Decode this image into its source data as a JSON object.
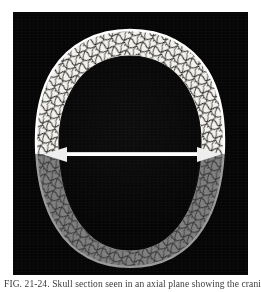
{
  "figure": {
    "kind": "medical-cross-section-illustration",
    "modality_label": "CT",
    "view": "axial skull cross-section",
    "panel": {
      "x": 13,
      "y": 12,
      "width": 235,
      "height": 263,
      "background_color": "#050505"
    },
    "colors": {
      "background": "#050505",
      "page": "#ffffff",
      "bone_bright": "#f4f2ee",
      "bone_bright_shadow": "#cfcbc4",
      "bone_dim": "#7e7e7e",
      "bone_dim_shadow": "#5a5a5a",
      "trabecular_line": "#1a1a1a",
      "cavity": "#050505",
      "marker_line": "#ffffff",
      "caption_text": "#3a3a3a"
    },
    "regions": [
      {
        "name": "upper-skull-vault",
        "label": "Upper half — bright cortical bone with diploic trabecular pattern",
        "fill": "#f4f2ee",
        "half": "superior"
      },
      {
        "name": "lower-skull-vault",
        "label": "Lower half — attenuated / dimmed bone of the same section",
        "fill": "#7e7e7e",
        "half": "inferior"
      },
      {
        "name": "cranial-cavity",
        "label": "Central cranial cavity (black)",
        "fill": "#050505"
      }
    ],
    "marker_line": {
      "name": "horizontal-reference-line",
      "label": "Horizontal white reference / level line with arrowheads at both ends",
      "color": "#ffffff",
      "x_start": 35,
      "x_end": 203,
      "y": 142,
      "thickness_px": 3,
      "arrowheads": "both"
    }
  },
  "caption": {
    "text": "FIG. 21-24. Skull section seen in an axial plane showing the cranial vault."
  }
}
